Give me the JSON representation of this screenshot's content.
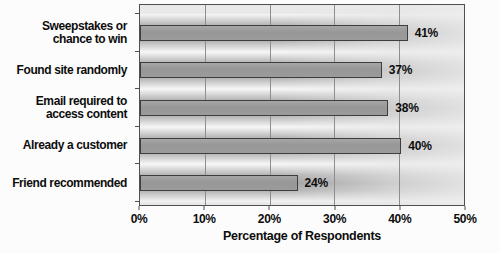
{
  "chart_data": {
    "type": "bar",
    "orientation": "horizontal",
    "title": "",
    "xlabel": "Percentage of Respondents",
    "categories": [
      "Sweepstakes or\nchance to win",
      "Found site randomly",
      "Email required to\naccess content",
      "Already a customer",
      "Friend recommended"
    ],
    "values": [
      41,
      37,
      38,
      40,
      24
    ],
    "value_labels": [
      "41%",
      "37%",
      "38%",
      "40%",
      "24%"
    ],
    "xticks": [
      "0%",
      "10%",
      "20%",
      "30%",
      "40%",
      "50%"
    ],
    "xlim": [
      0,
      50
    ],
    "grid": "vertical gridlines every 10%",
    "legend": "none",
    "colors": {
      "bar_fill": "#9b9b9b",
      "bar_border": "#3e3e3e",
      "plot_background": "#e9e9e9",
      "gridline": "#8d8d8d",
      "plot_border": "#4f4f4f",
      "text": "#0d0d0d"
    }
  }
}
